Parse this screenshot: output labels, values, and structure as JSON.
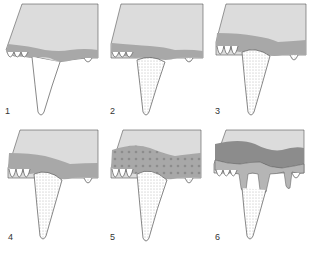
{
  "diagram": {
    "colors": {
      "bone": "#d9d9d9",
      "gum_band": "#a9a9a9",
      "dark_band": "#8c8c8c",
      "outline": "#444444",
      "tooth_fill": "#ffffff"
    },
    "panels": [
      {
        "label": "1",
        "stage": "plain tooth, thin gum band"
      },
      {
        "label": "2",
        "stage": "stippled tooth root area"
      },
      {
        "label": "3",
        "stage": "wider gum band, stippled tooth"
      },
      {
        "label": "4",
        "stage": "gum band thicker, stippling extends"
      },
      {
        "label": "5",
        "stage": "dotted gum tissue"
      },
      {
        "label": "6",
        "stage": "dark band, gum recession with drips"
      }
    ]
  }
}
